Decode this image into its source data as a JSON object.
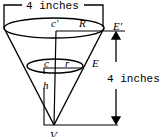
{
  "diagram": {
    "type": "truncated cone (frustum) inside cone",
    "top_dimension_label": "4 inches",
    "side_dimension_label": "4 inches",
    "points": {
      "top_center": "c'",
      "top_radius": "R",
      "top_edge": "E'",
      "bottom_center": "c",
      "bottom_radius": "r",
      "bottom_edge": "E",
      "height": "h",
      "vertex": "V"
    },
    "colors": {
      "stroke": "#000000",
      "background": "#ffffff"
    }
  }
}
